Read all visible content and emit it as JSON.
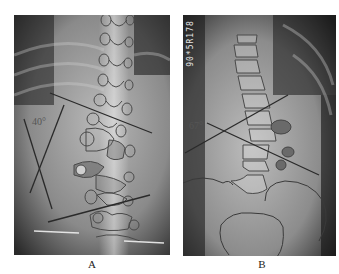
{
  "figure": {
    "panels": [
      {
        "id": "A",
        "caption": "A",
        "angle_label": "40°",
        "description": "AP radiograph of thoracolumbar spine with outlined vertebrae and Cobb angle lines"
      },
      {
        "id": "B",
        "caption": "B",
        "angle_label": "67°",
        "stamp_text": "90*5R178",
        "description": "AP radiograph of lumbar spine with outlined vertebrae, pelvis and Cobb angle lines"
      }
    ],
    "colors": {
      "background": "#ffffff",
      "line": "#333333",
      "outline": "#555555",
      "highlight_vertebra": "#777777"
    }
  }
}
